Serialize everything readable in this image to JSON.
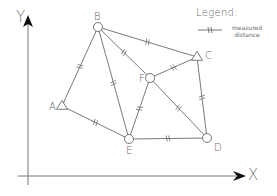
{
  "diagram": {
    "type": "survey-network",
    "axes": {
      "x_label": "X",
      "y_label": "Y"
    },
    "legend": {
      "title": "Legend:",
      "items": [
        {
          "symbol": "line-with-double-tick",
          "label_line1": "measured",
          "label_line2": "distance"
        }
      ]
    },
    "nodes": [
      {
        "id": "A",
        "label": "A",
        "shape": "triangle",
        "x": 62,
        "y": 106
      },
      {
        "id": "B",
        "label": "B",
        "shape": "circle",
        "x": 98,
        "y": 27
      },
      {
        "id": "C",
        "label": "C",
        "shape": "triangle",
        "x": 197,
        "y": 57
      },
      {
        "id": "D",
        "label": "D",
        "shape": "circle",
        "x": 207,
        "y": 138
      },
      {
        "id": "E",
        "label": "E",
        "shape": "circle",
        "x": 129,
        "y": 139
      },
      {
        "id": "F",
        "label": "F",
        "shape": "circle",
        "x": 150,
        "y": 78
      }
    ],
    "edges": [
      {
        "from": "A",
        "to": "B",
        "measured": true
      },
      {
        "from": "A",
        "to": "E",
        "measured": true
      },
      {
        "from": "B",
        "to": "E",
        "measured": true
      },
      {
        "from": "B",
        "to": "F",
        "measured": true
      },
      {
        "from": "B",
        "to": "C",
        "measured": true
      },
      {
        "from": "C",
        "to": "F",
        "measured": true
      },
      {
        "from": "C",
        "to": "D",
        "measured": true
      },
      {
        "from": "F",
        "to": "E",
        "measured": true
      },
      {
        "from": "F",
        "to": "D",
        "measured": true
      },
      {
        "from": "E",
        "to": "D",
        "measured": true
      }
    ],
    "colors": {
      "line": "#6a6a6a",
      "text": "#666666",
      "arrow": "#111111"
    }
  }
}
